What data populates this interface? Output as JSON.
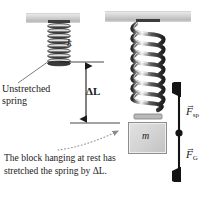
{
  "figure": {
    "background_color": "#ffffff"
  },
  "labels": {
    "spring_constant": "k",
    "mass": "m",
    "delta_l": "ΔL",
    "unstretched_spring": "Unstretched\nspring",
    "unstretched_spring_line1": "Unstretched",
    "unstretched_spring_line2": "spring",
    "caption": "The block hanging at rest has stretched the spring by ΔL.",
    "force_spring": "F",
    "force_spring_sub": "sp",
    "force_gravity": "F",
    "force_gravity_sub": "G",
    "vector_arrow": "→"
  },
  "elements": {
    "ceiling_left_name": "ceiling-support-left",
    "ceiling_right_name": "ceiling-support-right",
    "spring_left_name": "unstretched-spring",
    "spring_right_name": "stretched-spring",
    "block_name": "hanging-block"
  },
  "colors": {
    "ceiling": "#cfcfcf",
    "spring_dark": "#2f2f2f",
    "spring_light": "#f2f2f2",
    "block_fill": "#d2d2d2",
    "block_border": "#8d8d8d",
    "arrow": "#1a1a1a",
    "text": "#1a1a1a",
    "leader": "#7a7a7a"
  },
  "dimension": {
    "measure_label": "ΔL",
    "top_y": 62,
    "bottom_y": 123
  }
}
